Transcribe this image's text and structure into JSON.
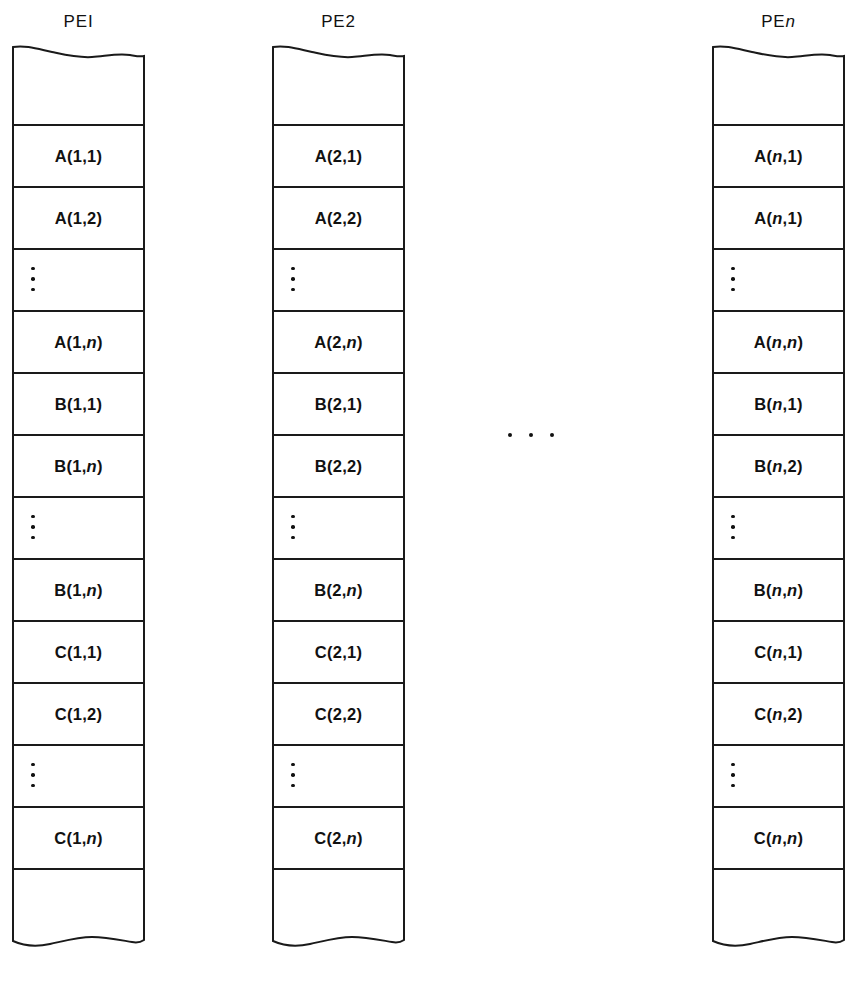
{
  "figure": {
    "background_color": "#ffffff",
    "line_color": "#1a1a1a",
    "text_color": "#111111",
    "between_columns_ellipsis": "...",
    "columns": [
      {
        "id": "pe1",
        "header_prefix": "PE",
        "header_suffix": "I",
        "header_suffix_italic": false,
        "header_full": "PEI",
        "left": 12,
        "cells": [
          {
            "type": "blank",
            "text": ""
          },
          {
            "type": "label",
            "text": "A(1,1)",
            "base": "A",
            "args": "(1,1)"
          },
          {
            "type": "label",
            "text": "A(1,2)",
            "base": "A",
            "args": "(1,2)"
          },
          {
            "type": "vdots",
            "text": ""
          },
          {
            "type": "label",
            "text": "A(1,n)",
            "base": "A",
            "args": "(1,n)"
          },
          {
            "type": "label",
            "text": "B(1,1)",
            "base": "B",
            "args": "(1,1)"
          },
          {
            "type": "label",
            "text": "B(1,n)",
            "base": "B",
            "args": "(1,n)"
          },
          {
            "type": "vdots",
            "text": ""
          },
          {
            "type": "label",
            "text": "B(1,n)",
            "base": "B",
            "args": "(1,n)"
          },
          {
            "type": "label",
            "text": "C(1,1)",
            "base": "C",
            "args": "(1,1)"
          },
          {
            "type": "label",
            "text": "C(1,2)",
            "base": "C",
            "args": "(1,2)"
          },
          {
            "type": "vdots",
            "text": ""
          },
          {
            "type": "label",
            "text": "C(1,n)",
            "base": "C",
            "args": "(1,n)"
          },
          {
            "type": "blank",
            "text": ""
          }
        ]
      },
      {
        "id": "pe2",
        "header_prefix": "PE",
        "header_suffix": "2",
        "header_suffix_italic": false,
        "header_full": "PE2",
        "left": 272,
        "cells": [
          {
            "type": "blank",
            "text": ""
          },
          {
            "type": "label",
            "text": "A(2,1)",
            "base": "A",
            "args": "(2,1)"
          },
          {
            "type": "label",
            "text": "A(2,2)",
            "base": "A",
            "args": "(2,2)"
          },
          {
            "type": "vdots",
            "text": ""
          },
          {
            "type": "label",
            "text": "A(2,n)",
            "base": "A",
            "args": "(2,n)"
          },
          {
            "type": "label",
            "text": "B(2,1)",
            "base": "B",
            "args": "(2,1)"
          },
          {
            "type": "label",
            "text": "B(2,2)",
            "base": "B",
            "args": "(2,2)"
          },
          {
            "type": "vdots",
            "text": ""
          },
          {
            "type": "label",
            "text": "B(2,n)",
            "base": "B",
            "args": "(2,n)"
          },
          {
            "type": "label",
            "text": "C(2,1)",
            "base": "C",
            "args": "(2,1)"
          },
          {
            "type": "label",
            "text": "C(2,2)",
            "base": "C",
            "args": "(2,2)"
          },
          {
            "type": "vdots",
            "text": ""
          },
          {
            "type": "label",
            "text": "C(2,n)",
            "base": "C",
            "args": "(2,n)"
          },
          {
            "type": "blank",
            "text": ""
          }
        ]
      },
      {
        "id": "pen",
        "header_prefix": "PE",
        "header_suffix": "n",
        "header_suffix_italic": true,
        "header_full": "PEn",
        "left": 712,
        "cells": [
          {
            "type": "blank",
            "text": ""
          },
          {
            "type": "label",
            "text": "A(n,1)",
            "base": "A",
            "args": "(n,1)"
          },
          {
            "type": "label",
            "text": "A(n,1)",
            "base": "A",
            "args": "(n,1)"
          },
          {
            "type": "vdots",
            "text": ""
          },
          {
            "type": "label",
            "text": "A(n,n)",
            "base": "A",
            "args": "(n,n)"
          },
          {
            "type": "label",
            "text": "B(n,1)",
            "base": "B",
            "args": "(n,1)"
          },
          {
            "type": "label",
            "text": "B(n,2)",
            "base": "B",
            "args": "(n,2)"
          },
          {
            "type": "vdots",
            "text": ""
          },
          {
            "type": "label",
            "text": "B(n,n)",
            "base": "B",
            "args": "(n,n)"
          },
          {
            "type": "label",
            "text": "C(n,1)",
            "base": "C",
            "args": "(n,1)"
          },
          {
            "type": "label",
            "text": "C(n,2)",
            "base": "C",
            "args": "(n,2)"
          },
          {
            "type": "vdots",
            "text": ""
          },
          {
            "type": "label",
            "text": "C(n,n)",
            "base": "C",
            "args": "(n,n)"
          },
          {
            "type": "blank",
            "text": ""
          }
        ]
      }
    ]
  }
}
